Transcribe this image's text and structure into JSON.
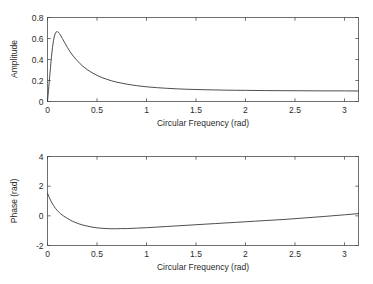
{
  "figure": {
    "background": "#ffffff",
    "axis_color": "#4d4d4d",
    "curve_color": "#3a3a3a"
  },
  "chart_data": [
    {
      "type": "line",
      "id": "amplitude-plot",
      "title": "",
      "xlabel": "Circular Frequency (rad)",
      "ylabel": "Amplitude",
      "xlim": [
        0,
        3.1416
      ],
      "ylim": [
        0,
        0.8
      ],
      "xticks": [
        0,
        0.5,
        1,
        1.5,
        2,
        2.5,
        3
      ],
      "xticklabels": [
        "0",
        "0.5",
        "1",
        "1.5",
        "2",
        "2.5",
        "3"
      ],
      "yticks": [
        0,
        0.2,
        0.4,
        0.6,
        0.8
      ],
      "yticklabels": [
        "0",
        "0.2",
        "0.4",
        "0.6",
        "0.8"
      ],
      "grid": false,
      "legend": null,
      "series": [
        {
          "name": "amplitude",
          "x": [
            0.0,
            0.01,
            0.02,
            0.03,
            0.04,
            0.05,
            0.06,
            0.07,
            0.08,
            0.09,
            0.1,
            0.11,
            0.12,
            0.13,
            0.15,
            0.17,
            0.2,
            0.23,
            0.26,
            0.3,
            0.35,
            0.4,
            0.45,
            0.5,
            0.55,
            0.6,
            0.65,
            0.7,
            0.8,
            0.9,
            1.0,
            1.1,
            1.2,
            1.3,
            1.4,
            1.5,
            1.6,
            1.7,
            1.8,
            1.9,
            2.0,
            2.2,
            2.4,
            2.6,
            2.8,
            3.0,
            3.1416
          ],
          "y": [
            0.0,
            0.105,
            0.215,
            0.325,
            0.425,
            0.512,
            0.578,
            0.623,
            0.651,
            0.664,
            0.665,
            0.659,
            0.648,
            0.634,
            0.6,
            0.566,
            0.516,
            0.471,
            0.432,
            0.388,
            0.342,
            0.304,
            0.274,
            0.249,
            0.228,
            0.211,
            0.196,
            0.184,
            0.165,
            0.151,
            0.14,
            0.132,
            0.126,
            0.121,
            0.117,
            0.114,
            0.112,
            0.11,
            0.108,
            0.107,
            0.106,
            0.104,
            0.103,
            0.102,
            0.101,
            0.101,
            0.1
          ]
        }
      ]
    },
    {
      "type": "line",
      "id": "phase-plot",
      "title": "",
      "xlabel": "Circular Frequency (rad)",
      "ylabel": "Phase (rad)",
      "xlim": [
        0,
        3.1416
      ],
      "ylim": [
        -2,
        4
      ],
      "xticks": [
        0,
        0.5,
        1,
        1.5,
        2,
        2.5,
        3
      ],
      "xticklabels": [
        "0",
        "0.5",
        "1",
        "1.5",
        "2",
        "2.5",
        "3"
      ],
      "yticks": [
        -2,
        0,
        2,
        4
      ],
      "yticklabels": [
        "-2",
        "0",
        "2",
        "4"
      ],
      "grid": false,
      "legend": null,
      "series": [
        {
          "name": "phase",
          "x": [
            0.0,
            0.02,
            0.04,
            0.06,
            0.08,
            0.1,
            0.13,
            0.16,
            0.2,
            0.25,
            0.3,
            0.35,
            0.4,
            0.45,
            0.5,
            0.55,
            0.6,
            0.65,
            0.7,
            0.75,
            0.8,
            0.9,
            1.0,
            1.1,
            1.2,
            1.3,
            1.4,
            1.5,
            1.6,
            1.7,
            1.8,
            1.9,
            2.0,
            2.1,
            2.2,
            2.4,
            2.6,
            2.8,
            3.0,
            3.1416
          ],
          "y": [
            1.52,
            1.21,
            0.93,
            0.7,
            0.51,
            0.35,
            0.15,
            0.0,
            -0.17,
            -0.36,
            -0.5,
            -0.61,
            -0.69,
            -0.76,
            -0.81,
            -0.84,
            -0.86,
            -0.87,
            -0.87,
            -0.86,
            -0.86,
            -0.83,
            -0.8,
            -0.76,
            -0.72,
            -0.68,
            -0.64,
            -0.6,
            -0.56,
            -0.52,
            -0.48,
            -0.44,
            -0.4,
            -0.36,
            -0.32,
            -0.24,
            -0.14,
            -0.04,
            0.07,
            0.15
          ]
        }
      ]
    }
  ]
}
